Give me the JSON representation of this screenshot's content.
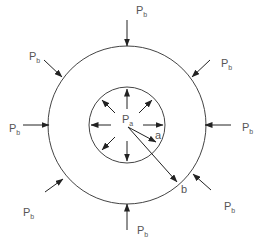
{
  "diagram": {
    "center": [
      127,
      125
    ],
    "inner_radius": 38,
    "outer_radius": 79,
    "internal_pressure": {
      "main": "P",
      "sub": "a"
    },
    "external_pressure": {
      "main": "P",
      "sub": "b"
    },
    "radius_labels": {
      "inner": "a",
      "outer": "b"
    },
    "external_labels": [
      {
        "x": 136,
        "y": 14
      },
      {
        "x": 29,
        "y": 60
      },
      {
        "x": 221,
        "y": 67
      },
      {
        "x": 9,
        "y": 132
      },
      {
        "x": 242,
        "y": 131
      },
      {
        "x": 23,
        "y": 216
      },
      {
        "x": 224,
        "y": 210
      },
      {
        "x": 137,
        "y": 234
      }
    ],
    "colors": {
      "stroke": "#333333",
      "text": "#555555",
      "background": "#ffffff"
    }
  }
}
